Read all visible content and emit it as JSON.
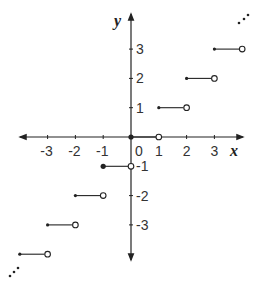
{
  "chart_data": {
    "type": "line",
    "title": "",
    "function": "greatest integer (floor) step function",
    "xlabel": "x",
    "ylabel": "y",
    "xlim": [
      -4,
      4
    ],
    "ylim": [
      -4,
      4
    ],
    "grid": false,
    "x_ticks": [
      -3,
      -2,
      -1,
      0,
      1,
      2,
      3
    ],
    "y_ticks": [
      -3,
      -2,
      -1,
      1,
      2,
      3
    ],
    "x_tick_labels": [
      "-3",
      "-2",
      "-1",
      "0",
      "1",
      "2",
      "3"
    ],
    "y_tick_labels": [
      "3",
      "2",
      "1",
      "-1",
      "-2",
      "-3"
    ],
    "origin_label": "0",
    "segments": [
      {
        "x_start": -4,
        "x_end": -3,
        "y": -4,
        "start_closed": true,
        "end_open": true
      },
      {
        "x_start": -3,
        "x_end": -2,
        "y": -3,
        "start_closed": true,
        "end_open": true
      },
      {
        "x_start": -2,
        "x_end": -1,
        "y": -2,
        "start_closed": true,
        "end_open": true
      },
      {
        "x_start": -1,
        "x_end": 0,
        "y": -1,
        "start_closed": true,
        "end_open": true
      },
      {
        "x_start": 0,
        "x_end": 1,
        "y": 0,
        "start_closed": true,
        "end_open": true
      },
      {
        "x_start": 1,
        "x_end": 2,
        "y": 1,
        "start_closed": true,
        "end_open": true
      },
      {
        "x_start": 2,
        "x_end": 3,
        "y": 2,
        "start_closed": true,
        "end_open": true
      },
      {
        "x_start": 3,
        "x_end": 4,
        "y": 3,
        "start_closed": true,
        "end_open": true
      }
    ],
    "continuation_marks": [
      "upper-right ellipsis",
      "lower-left ellipsis"
    ]
  },
  "colors": {
    "ink": "#222222",
    "background": "#ffffff"
  }
}
